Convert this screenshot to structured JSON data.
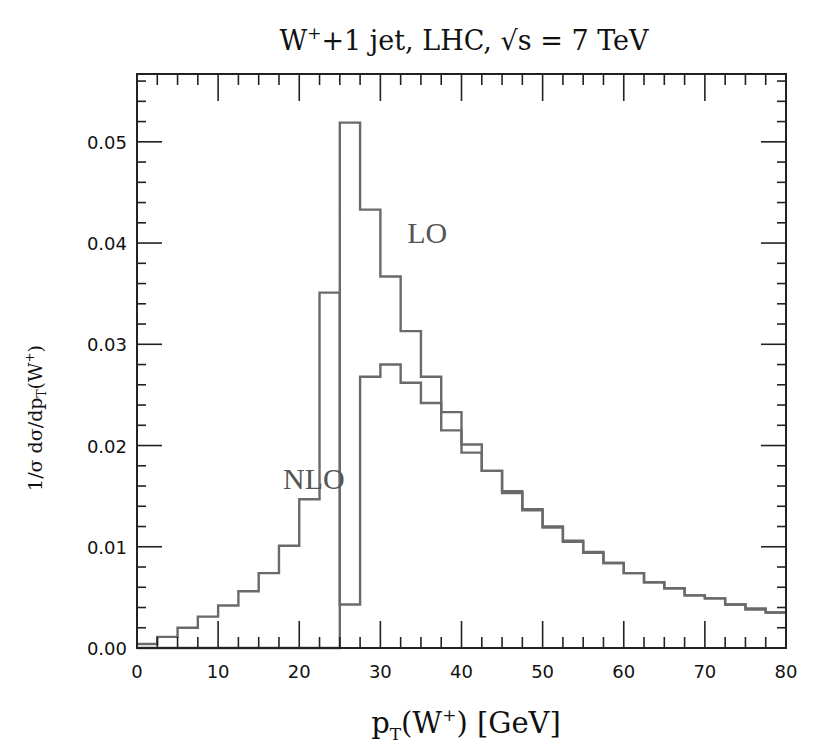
{
  "chart_data": {
    "type": "histogram-step",
    "title_parts": {
      "main": "W",
      "sup": "+",
      "rest": "+1 jet, LHC, √s = 7 TeV"
    },
    "xlabel": "p_T(W⁺) [GeV]",
    "xlabel_parts": {
      "p": "p",
      "sub": "T",
      "mid": "(W",
      "sup": "+",
      "end": ")  [GeV]"
    },
    "ylabel": "1/σ dσ/dp_T(W⁺)",
    "ylabel_parts": {
      "pre": "1/σ  dσ/dp",
      "sub": "T",
      "mid": "(W",
      "sup": "+",
      "end": ")"
    },
    "xlim": [
      0,
      80
    ],
    "ylim": [
      0,
      0.0567
    ],
    "xticks": [
      0,
      10,
      20,
      30,
      40,
      50,
      60,
      70,
      80
    ],
    "xtick_labels": [
      "0",
      "10",
      "20",
      "30",
      "40",
      "50",
      "60",
      "70",
      "80"
    ],
    "x_minor_step": 2.5,
    "yticks": [
      0,
      0.01,
      0.02,
      0.03,
      0.04,
      0.05
    ],
    "ytick_labels": [
      "0.00",
      "0.01",
      "0.02",
      "0.03",
      "0.04",
      "0.05"
    ],
    "y_minor_step": 0.002,
    "grid": false,
    "legend": "inline text labels",
    "bin_width": 2.5,
    "bin_edges_start": 0,
    "series": [
      {
        "name": "NLO",
        "label_pos": [
          18,
          0.0157
        ],
        "values": [
          0.0004,
          0.0011,
          0.002,
          0.0031,
          0.0042,
          0.0056,
          0.0074,
          0.0101,
          0.0147,
          0.0351,
          0.0043,
          0.0268,
          0.028,
          0.0262,
          0.0242,
          0.0215,
          0.0193,
          0.0175,
          0.0153,
          0.0136,
          0.0119,
          0.0105,
          0.0094,
          0.0084,
          0.0074,
          0.0065,
          0.0059,
          0.0052,
          0.0049,
          0.0043,
          0.0038,
          0.0035
        ]
      },
      {
        "name": "LO",
        "label_pos": [
          33.3,
          0.04
        ],
        "values": [
          0,
          0,
          0,
          0,
          0,
          0,
          0,
          0,
          0,
          0,
          0.0519,
          0.0433,
          0.0367,
          0.0313,
          0.0268,
          0.0233,
          0.0201,
          0.0175,
          0.0155,
          0.0137,
          0.012,
          0.0106,
          0.0095,
          0.0084,
          0.0074,
          0.0065,
          0.0059,
          0.0052,
          0.0049,
          0.0043,
          0.0039,
          0.0035
        ]
      }
    ],
    "colors": {
      "lines": "#6a6a6a",
      "labels": "#555555",
      "frame": "#222222",
      "text": "#111111"
    }
  }
}
